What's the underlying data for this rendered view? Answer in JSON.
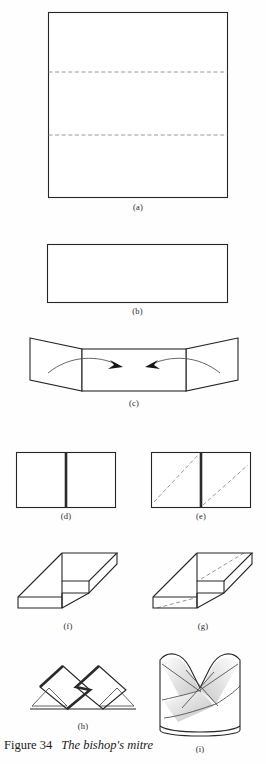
{
  "figure": {
    "number_label": "Figure 34",
    "title": "The bishop's mitre",
    "background_color": "#fefefe",
    "line_color": "#3a3a3a",
    "fold_line_color": "#8c8c8c",
    "emphasis_line_color": "#2b2b2b"
  },
  "steps": [
    {
      "id": "a",
      "label": "(a)",
      "description": "Square sheet with two horizontal dashed fold lines dividing it into thirds"
    },
    {
      "id": "b",
      "label": "(b)",
      "description": "Folded flat into a wide horizontal rectangle"
    },
    {
      "id": "c",
      "label": "(c)",
      "description": "Rectangle with left and right side panels swung outward, two curved arrows pointing inward"
    },
    {
      "id": "d",
      "label": "(d)",
      "description": "Rectangle with a thick vertical centre crease"
    },
    {
      "id": "e",
      "label": "(e)",
      "description": "Same rectangle with two parallel diagonal dashed fold lines"
    },
    {
      "id": "f",
      "label": "(f)",
      "description": "Stepped Z-shaped three-dimensional form in isometric view"
    },
    {
      "id": "g",
      "label": "(g)",
      "description": "Stepped Z-shaped form with two parallel diagonal dashed fold lines"
    },
    {
      "id": "h",
      "label": "(h)",
      "description": "Flattened figure of two overlapping rotated squares on a baseline"
    },
    {
      "id": "i",
      "label": "(i)",
      "description": "Completed bishop's mitre, a rounded body with two raised points and shaded crossing folds"
    }
  ]
}
